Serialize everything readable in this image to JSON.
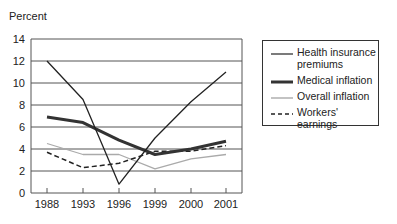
{
  "chart_data": {
    "type": "line",
    "title": "",
    "xlabel": "",
    "ylabel": "Percent",
    "categories": [
      "1988",
      "1993",
      "1996",
      "1999",
      "2000",
      "2001"
    ],
    "yticks": [
      0,
      2,
      4,
      6,
      8,
      10,
      12,
      14
    ],
    "ylim": [
      0,
      14
    ],
    "grid": true,
    "legend_position": "right",
    "series": [
      {
        "name": "Health insurance premiums",
        "values": [
          12.0,
          8.5,
          0.8,
          5.0,
          8.3,
          11.0
        ],
        "style": "thin-solid",
        "color": "#222222"
      },
      {
        "name": "Medical inflation",
        "values": [
          6.9,
          6.4,
          4.8,
          3.5,
          4.0,
          4.7
        ],
        "style": "thick-solid",
        "color": "#333333"
      },
      {
        "name": "Overall inflation",
        "values": [
          4.5,
          3.5,
          3.5,
          2.2,
          3.1,
          3.5
        ],
        "style": "thin-solid",
        "color": "#aaaaaa"
      },
      {
        "name": "Workers' earnings",
        "values": [
          3.7,
          2.3,
          2.7,
          3.8,
          3.8,
          4.3
        ],
        "style": "dashed",
        "color": "#222222"
      }
    ]
  },
  "legend": {
    "items": [
      "Health insurance premiums",
      "Medical inflation",
      "Overall inflation",
      "Workers' earnings"
    ]
  }
}
